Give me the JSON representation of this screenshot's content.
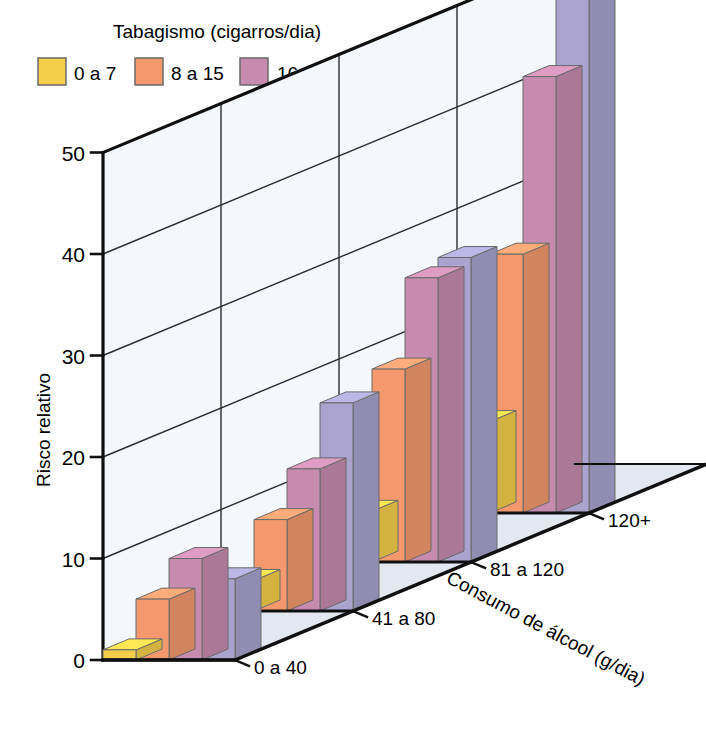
{
  "legend": {
    "title": "Tabagismo (cigarros/dia)",
    "items": [
      {
        "label": "0 a 7",
        "color": "#f6cf4a"
      },
      {
        "label": "8 a 15",
        "color": "#f3996d"
      },
      {
        "label": "16 a 25",
        "color": "#c78bb0"
      },
      {
        "label": "26+",
        "color": "#a9a3ce"
      }
    ]
  },
  "axes": {
    "y_title": "Risco relativo",
    "y_ticks": [
      "0",
      "10",
      "20",
      "30",
      "40",
      "50"
    ],
    "z_title": "Consumo de álcool (g/dia)",
    "z_ticks": [
      "0 a 40",
      "41 a 80",
      "81 a 120",
      "120+"
    ]
  },
  "colors": {
    "wall": "#f4f7fb",
    "floor": "#e3e8f0",
    "grid": "#2b2b2b",
    "frame": "#101010",
    "bar_outline": "#6a6a6a"
  },
  "chart_data": {
    "type": "bar",
    "chart_style": "3d-grouped-bar",
    "title": "",
    "xlabel": "Consumo de álcool (g/dia)",
    "ylabel": "Risco relativo",
    "legend_title": "Tabagismo (cigarros/dia)",
    "legend_position": "top-left",
    "grid": true,
    "ylim": [
      0,
      50
    ],
    "yticks": [
      0,
      10,
      20,
      30,
      40,
      50
    ],
    "categories": [
      "0 a 40",
      "41 a 80",
      "81 a 120",
      "120+"
    ],
    "series": [
      {
        "name": "0 a 7",
        "color": "#f6cf4a",
        "values": [
          1.0,
          3.0,
          5.0,
          9.0
        ]
      },
      {
        "name": "8 a 15",
        "color": "#f3996d",
        "values": [
          6.0,
          9.0,
          19.0,
          25.5
        ]
      },
      {
        "name": "16 a 25",
        "color": "#c78bb0",
        "values": [
          10.0,
          14.0,
          28.0,
          43.0
        ]
      },
      {
        "name": "26+",
        "color": "#a9a3ce",
        "values": [
          8.0,
          20.5,
          30.0,
          53.0
        ]
      }
    ]
  }
}
